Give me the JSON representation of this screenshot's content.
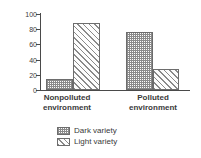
{
  "chart_data": {
    "type": "bar",
    "title": "",
    "xlabel": "",
    "ylabel": "% of Moth Variety",
    "ylim": [
      0,
      100
    ],
    "yticks": [
      0,
      20,
      40,
      60,
      80,
      100
    ],
    "grid": false,
    "legend_position": "bottom-center",
    "categories": [
      "Nonpolluted environment",
      "Polluted environment"
    ],
    "category_lines": [
      [
        "Nonpolluted",
        "environment"
      ],
      [
        "Polluted",
        "environment"
      ]
    ],
    "series": [
      {
        "name": "Dark variety",
        "pattern": "checkered",
        "values": [
          14,
          76
        ]
      },
      {
        "name": "Light variety",
        "pattern": "diagonal-hatch",
        "values": [
          88,
          28
        ]
      }
    ]
  },
  "axis": {
    "y_title": "% of Moth Variety",
    "y_tick_labels": [
      "100",
      "80",
      "60",
      "40",
      "20",
      "0"
    ]
  },
  "legend": {
    "items": [
      {
        "label": "Dark variety"
      },
      {
        "label": "Light variety"
      }
    ]
  },
  "colors": {
    "ink": "#3a3a3a",
    "axis": "#4a4a4a",
    "pattern": "#8a8a8a",
    "bar_border": "#6d6d6d",
    "background": "#ffffff"
  }
}
